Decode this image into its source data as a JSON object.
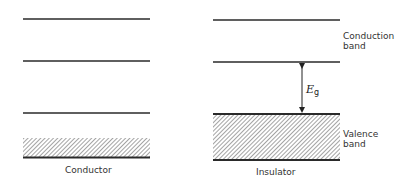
{
  "diagram": {
    "conductor": {
      "label": "Conductor",
      "levels_y": [
        19,
        61,
        113
      ],
      "band": {
        "top": 138,
        "bottom": 157
      }
    },
    "insulator": {
      "label": "Insulator",
      "levels_y": [
        20,
        62
      ],
      "band": {
        "top": 114,
        "bottom": 160
      }
    },
    "labels": {
      "conduction_line1": "Conduction",
      "conduction_line2": "band",
      "valence_line1": "Valence",
      "valence_line2": "band",
      "gap_symbol": "E",
      "gap_subscript": "g"
    },
    "colors": {
      "line": "#2a2a2a",
      "hatch": "#555555",
      "background": "#ffffff"
    }
  }
}
